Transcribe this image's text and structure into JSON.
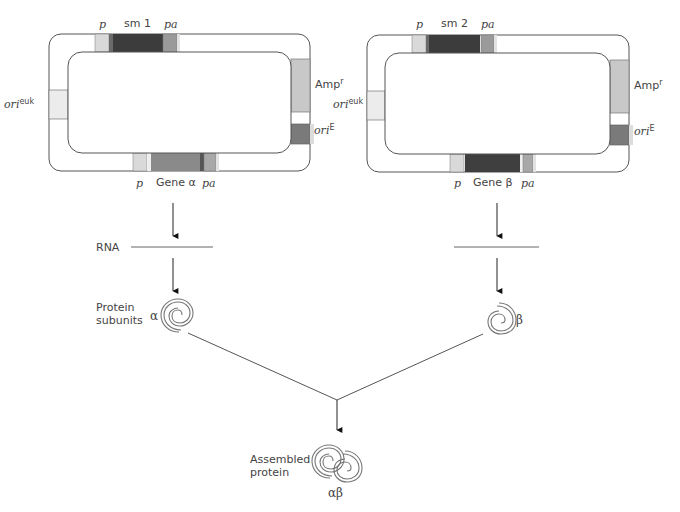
{
  "figure": {
    "plasmids": [
      {
        "id": "plasmid-1",
        "top_labels": {
          "promoter": "p",
          "marker": "sm 1",
          "polyA": "pa"
        },
        "bottom_labels": {
          "promoter": "p",
          "gene": "Gene α",
          "polyA": "pa"
        },
        "left_label": {
          "base": "ori",
          "sup": "euk"
        },
        "right_labels": [
          {
            "base": "Amp",
            "sup": "r"
          },
          {
            "base": "ori",
            "sup": "E"
          }
        ],
        "colors": {
          "promoter": "#d9d9d9",
          "marker": "#3c3c3c",
          "polyA": "#9a9a9a",
          "gene": "#8a8a8a",
          "amp": "#c8c8c8",
          "oriE": "#7a7a7a",
          "oriEuk": "#ececec"
        }
      },
      {
        "id": "plasmid-2",
        "top_labels": {
          "promoter": "p",
          "marker": "sm 2",
          "polyA": "pa"
        },
        "bottom_labels": {
          "promoter": "p",
          "gene": "Gene β",
          "polyA": "pa"
        },
        "left_label": {
          "base": "ori",
          "sup": "euk"
        },
        "right_labels": [
          {
            "base": "Amp",
            "sup": "r"
          },
          {
            "base": "ori",
            "sup": "E"
          }
        ],
        "colors": {
          "promoter": "#d9d9d9",
          "marker": "#3c3c3c",
          "polyA": "#9a9a9a",
          "gene": "#3f3f3f",
          "amp": "#c8c8c8",
          "oriE": "#7a7a7a",
          "oriEuk": "#ececec"
        }
      }
    ],
    "stages": {
      "rna": "RNA",
      "protein_subunits": [
        "Protein",
        "subunits"
      ],
      "assembled_protein": [
        "Assembled",
        "protein"
      ]
    },
    "subunits": {
      "alpha": "α",
      "beta": "β",
      "complex": "αβ"
    }
  }
}
